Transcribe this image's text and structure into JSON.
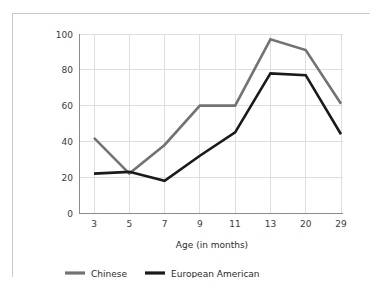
{
  "chart_data": {
    "type": "line",
    "title": "",
    "xlabel": "Age (in months)",
    "ylabel": "Separation: percent fretting/crying",
    "categories": [
      "3",
      "5",
      "7",
      "9",
      "11",
      "13",
      "20",
      "29"
    ],
    "ylim": [
      0,
      100
    ],
    "yticks": [
      "0",
      "20",
      "40",
      "60",
      "80",
      "100"
    ],
    "grid": "both",
    "legend_position": "bottom",
    "series": [
      {
        "name": "Chinese",
        "color": "#737373",
        "values": [
          42,
          22,
          38,
          60,
          60,
          97,
          91,
          61
        ]
      },
      {
        "name": "European American",
        "color": "#1a1a1a",
        "values": [
          22,
          23,
          18,
          32,
          45,
          78,
          77,
          44
        ]
      }
    ]
  },
  "axes": {
    "y_title": "Separation: percent fretting/crying",
    "x_title": "Age (in months)",
    "y_ticks": [
      "100",
      "80",
      "60",
      "40",
      "20",
      "0"
    ],
    "x_ticks": [
      "3",
      "5",
      "7",
      "9",
      "11",
      "13",
      "20",
      "29"
    ]
  },
  "legend": {
    "items": [
      {
        "label": "Chinese",
        "color": "#737373"
      },
      {
        "label": "European American",
        "color": "#1a1a1a"
      }
    ]
  },
  "colors": {
    "frame_border": "#c9c9c9",
    "gridline": "#dededa",
    "axis": "#8c8c8c",
    "background": "#ffffff",
    "chinese_series": "#737373",
    "european_american_series": "#1a1a1a"
  }
}
